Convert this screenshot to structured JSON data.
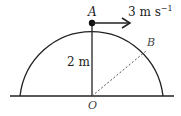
{
  "diagram": {
    "points": {
      "A": {
        "label": "A"
      },
      "B": {
        "label": "B"
      },
      "O": {
        "label": "O"
      }
    },
    "radius_label": "2 m",
    "velocity": {
      "value": "3 m s",
      "exponent": "−1"
    },
    "colors": {
      "stroke": "#222222",
      "dashed": "#555555"
    }
  }
}
